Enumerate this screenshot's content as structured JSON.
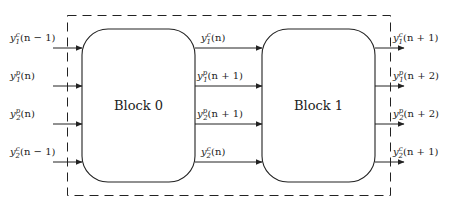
{
  "diagram": {
    "blocks": [
      {
        "id": "block0",
        "label": "Block 0"
      },
      {
        "id": "block1",
        "label": "Block 1"
      }
    ],
    "inputs": [
      {
        "base": "y",
        "sub": "1",
        "sup": "c",
        "arg": "(n − 1)"
      },
      {
        "base": "y",
        "sub": "1",
        "sup": "p",
        "arg": "(n)"
      },
      {
        "base": "y",
        "sub": "2",
        "sup": "p",
        "arg": "(n)"
      },
      {
        "base": "y",
        "sub": "2",
        "sup": "c",
        "arg": "(n − 1)"
      }
    ],
    "middle": [
      {
        "base": "y",
        "sub": "1",
        "sup": "c",
        "arg": "(n)"
      },
      {
        "base": "y",
        "sub": "1",
        "sup": "p",
        "arg": "(n + 1)"
      },
      {
        "base": "y",
        "sub": "2",
        "sup": "p",
        "arg": "(n + 1)"
      },
      {
        "base": "y",
        "sub": "2",
        "sup": "c",
        "arg": "(n)"
      }
    ],
    "outputs": [
      {
        "base": "y",
        "sub": "1",
        "sup": "c",
        "arg": "(n + 1)"
      },
      {
        "base": "y",
        "sub": "1",
        "sup": "p",
        "arg": "(n + 2)"
      },
      {
        "base": "y",
        "sub": "2",
        "sup": "p",
        "arg": "(n + 2)"
      },
      {
        "base": "y",
        "sub": "2",
        "sup": "c",
        "arg": "(n + 1)"
      }
    ],
    "colors": {
      "stroke": "#222222",
      "background": "#ffffff"
    }
  }
}
